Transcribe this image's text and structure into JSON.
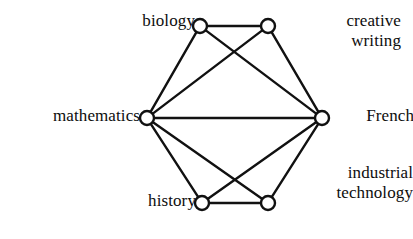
{
  "figure": {
    "type": "graph-diagram",
    "title": "",
    "background_color": "#ffffff",
    "edge_color": "#111111",
    "node_fill_color": "#ffffff",
    "node_stroke_color": "#111111"
  },
  "nodes": [
    {
      "id": "biology",
      "label": "biology",
      "label_line2": "",
      "x": 200,
      "y": 26,
      "r": 7
    },
    {
      "id": "creative-writing",
      "label": "creative",
      "label_line2": "writing",
      "x": 268,
      "y": 26,
      "r": 7
    },
    {
      "id": "mathematics",
      "label": "mathematics",
      "label_line2": "",
      "x": 147,
      "y": 118,
      "r": 7
    },
    {
      "id": "french",
      "label": "French",
      "label_line2": "",
      "x": 322,
      "y": 118,
      "r": 7
    },
    {
      "id": "history",
      "label": "history",
      "label_line2": "",
      "x": 202,
      "y": 203,
      "r": 7
    },
    {
      "id": "industrial-technology",
      "label": "industrial",
      "label_line2": "technology",
      "x": 268,
      "y": 203,
      "r": 7
    }
  ],
  "edges": [
    {
      "from": "biology",
      "to": "creative-writing"
    },
    {
      "from": "biology",
      "to": "mathematics"
    },
    {
      "from": "biology",
      "to": "french"
    },
    {
      "from": "creative-writing",
      "to": "mathematics"
    },
    {
      "from": "creative-writing",
      "to": "french"
    },
    {
      "from": "mathematics",
      "to": "french"
    },
    {
      "from": "mathematics",
      "to": "history"
    },
    {
      "from": "mathematics",
      "to": "industrial-technology"
    },
    {
      "from": "french",
      "to": "history"
    },
    {
      "from": "french",
      "to": "industrial-technology"
    },
    {
      "from": "history",
      "to": "industrial-technology"
    }
  ],
  "labels": {
    "biology": "biology",
    "creative_line1": "creative",
    "creative_line2": "writing",
    "mathematics": "mathematics",
    "french": "French",
    "history": "history",
    "industrial_line1": "industrial",
    "industrial_line2": "technology"
  }
}
